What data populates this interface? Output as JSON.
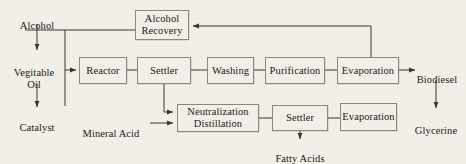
{
  "diagram": {
    "background_color": "#f2efe9",
    "line_color": "#3a3733",
    "box_border_color": "#8c8880",
    "text_color": "#1c1a17",
    "boxes": [
      {
        "id": "alcohol-recovery",
        "label": "Alcohol\nRecovery",
        "x": 135,
        "y": 10,
        "w": 54,
        "h": 30
      },
      {
        "id": "reactor",
        "label": "Reactor",
        "x": 79,
        "y": 57,
        "w": 48,
        "h": 27
      },
      {
        "id": "settler-top",
        "label": "Settler",
        "x": 137,
        "y": 57,
        "w": 54,
        "h": 27
      },
      {
        "id": "washing",
        "label": "Washing",
        "x": 207,
        "y": 57,
        "w": 47,
        "h": 27
      },
      {
        "id": "purification",
        "label": "Purification",
        "x": 265,
        "y": 57,
        "w": 60,
        "h": 27
      },
      {
        "id": "evaporation-top",
        "label": "Evaporation",
        "x": 337,
        "y": 57,
        "w": 62,
        "h": 27
      },
      {
        "id": "neutralization-distillation",
        "label": "Neutralization\nDistillation",
        "x": 177,
        "y": 104,
        "w": 82,
        "h": 28
      },
      {
        "id": "settler-bottom",
        "label": "Settler",
        "x": 272,
        "y": 105,
        "w": 56,
        "h": 26
      },
      {
        "id": "evaporation-bottom",
        "label": "Evaporation",
        "x": 340,
        "y": 103,
        "w": 57,
        "h": 28
      }
    ],
    "labels": [
      {
        "id": "alcohol",
        "text": "Alcohol",
        "x": 6,
        "y": 8,
        "w": 62
      },
      {
        "id": "vegitable-oil",
        "text": "Vegitable\nOil",
        "x": 2,
        "y": 55,
        "w": 64
      },
      {
        "id": "catalyst",
        "text": "Catalyst",
        "x": 6,
        "y": 110,
        "w": 62
      },
      {
        "id": "mineral-acid",
        "text": "Mineral Acid",
        "x": 75,
        "y": 112,
        "w": 72
      },
      {
        "id": "biodiesel",
        "text": "Biodiesel",
        "x": 410,
        "y": 62,
        "w": 54
      },
      {
        "id": "glycerine",
        "text": "Glycerine",
        "x": 408,
        "y": 113,
        "w": 56
      },
      {
        "id": "fatty-acids",
        "text": "Fatty Acids",
        "x": 268,
        "y": 141,
        "w": 64
      }
    ],
    "connections": [
      {
        "id": "alcohol-to-vegitable-oil",
        "from": "alcohol",
        "to": "vegitable-oil",
        "arrow": true
      },
      {
        "id": "vegitable-oil-to-catalyst",
        "from": "vegitable-oil",
        "to": "catalyst",
        "arrow": true
      },
      {
        "id": "feed-header-to-reactor",
        "from": "feed-header",
        "to": "reactor",
        "arrow": true
      },
      {
        "id": "alcohol-recovery-to-feed-header",
        "from": "alcohol-recovery",
        "to": "feed-header",
        "arrow": false
      },
      {
        "id": "reactor-to-settler-top",
        "from": "reactor",
        "to": "settler-top",
        "arrow": false
      },
      {
        "id": "settler-top-to-washing",
        "from": "settler-top",
        "to": "washing",
        "arrow": false
      },
      {
        "id": "washing-to-purification",
        "from": "washing",
        "to": "purification",
        "arrow": false
      },
      {
        "id": "purification-to-evaporation-top",
        "from": "purification",
        "to": "evaporation-top",
        "arrow": false
      },
      {
        "id": "evaporation-top-to-biodiesel",
        "from": "evaporation-top",
        "to": "biodiesel",
        "arrow": true
      },
      {
        "id": "evaporation-top-to-alcohol-recovery",
        "from": "evaporation-top",
        "to": "alcohol-recovery",
        "arrow": true
      },
      {
        "id": "biodiesel-to-glycerine",
        "from": "biodiesel",
        "to": "glycerine",
        "arrow": true
      },
      {
        "id": "settler-top-to-neutralization",
        "from": "settler-top",
        "to": "neutralization-distillation",
        "arrow": true
      },
      {
        "id": "mineral-acid-to-neutralization",
        "from": "mineral-acid",
        "to": "neutralization-distillation",
        "arrow": true
      },
      {
        "id": "neutralization-to-settler-bottom",
        "from": "neutralization-distillation",
        "to": "settler-bottom",
        "arrow": false
      },
      {
        "id": "settler-bottom-to-evaporation-bottom",
        "from": "settler-bottom",
        "to": "evaporation-bottom",
        "arrow": false
      },
      {
        "id": "settler-bottom-to-fatty-acids",
        "from": "settler-bottom",
        "to": "fatty-acids",
        "arrow": true
      }
    ]
  }
}
